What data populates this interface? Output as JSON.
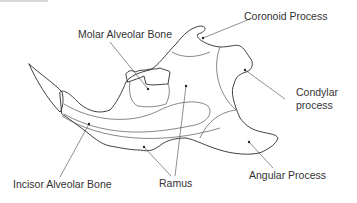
{
  "diagram": {
    "labels": {
      "coronoid": "Coronoid Process",
      "molar": "Molar Alveolar Bone",
      "condylar_line1": "Condylar",
      "condylar_line2": "process",
      "incisor": "Incisor Alveolar Bone",
      "ramus": "Ramus",
      "angular": "Angular Process"
    },
    "colors": {
      "outline": "#2b2b2b",
      "text": "#333333",
      "background": "#ffffff"
    }
  }
}
